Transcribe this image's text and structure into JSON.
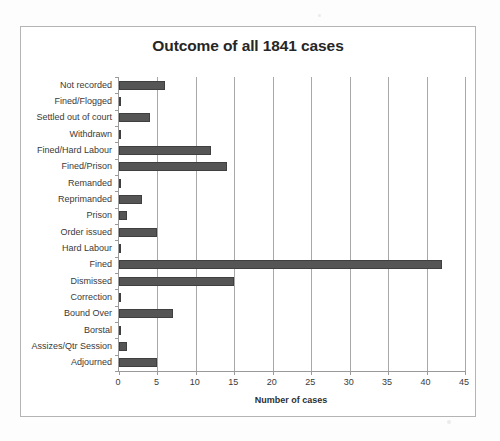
{
  "chart_data": {
    "type": "bar",
    "orientation": "horizontal",
    "title": "Outcome of all 1841 cases",
    "xlabel": "Number of cases",
    "ylabel": "",
    "xlim": [
      0,
      45
    ],
    "xticks": [
      0,
      5,
      10,
      15,
      20,
      25,
      30,
      35,
      40,
      45
    ],
    "grid": "vertical",
    "legend": "none",
    "bar_color": "#555555",
    "categories": [
      "Not recorded",
      "Fined/Flogged",
      "Settled out of court",
      "Withdrawn",
      "Fined/Hard Labour",
      "Fined/Prison",
      "Remanded",
      "Reprimanded",
      "Prison",
      "Order issued",
      "Hard Labour",
      "Fined",
      "Dismissed",
      "Correction",
      "Bound Over",
      "Borstal",
      "Assizes/Qtr Session",
      "Adjourned"
    ],
    "values": [
      6,
      0.2,
      4,
      0.2,
      12,
      14,
      0.2,
      3,
      1,
      5,
      0.2,
      42,
      15,
      0.2,
      7,
      0.2,
      1,
      5
    ]
  }
}
